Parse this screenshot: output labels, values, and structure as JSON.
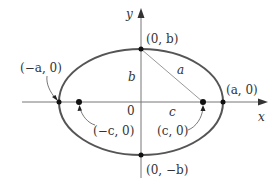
{
  "diagram": {
    "type": "ellipse-foci",
    "colors": {
      "ellipse": "#555555",
      "axis": "#777777",
      "segment": "#999999",
      "point": "#111111",
      "text": "#333333"
    },
    "axes": {
      "x_label": "x",
      "y_label": "y",
      "origin_label": "0"
    },
    "points": {
      "top_vertex": "(0, b)",
      "bottom_vertex": "(0, −b)",
      "left_vertex": "(−a, 0)",
      "right_vertex": "(a, 0)",
      "left_focus": "(−c, 0)",
      "right_focus": "(c, 0)"
    },
    "segments": {
      "semi_minor": "b",
      "hypotenuse": "a",
      "focal_distance": "c"
    }
  }
}
